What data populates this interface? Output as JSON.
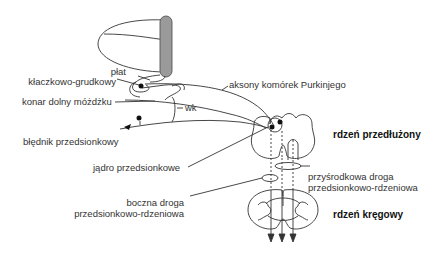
{
  "diagram": {
    "type": "neuroanatomy-schematic",
    "language": "pl",
    "labels": {
      "flocculonodular_lobe_1": "płat",
      "flocculonodular_lobe_2": "kłaczkowo-grudkowy",
      "inferior_cerebellar_peduncle": "konar dolny móżdżku",
      "wk": "wk",
      "purkinje_axons": "aksony komórek Purkinjego",
      "vestibular_labyrinth": "błędnik przedsionkowy",
      "vestibular_nucleus": "jądro przedsionkowe",
      "lateral_tract_1": "boczna droga",
      "lateral_tract_2": "przedsionkowo-rdzeniowa",
      "medial_tract_1": "przyśrodkowa droga",
      "medial_tract_2": "przedsionkowo-rdzeniowa",
      "medulla": "rdzeń przedłużony",
      "spinal_cord": "rdzeń kręgowy"
    },
    "colors": {
      "line": "#333333",
      "cerebellum_fill": "#9a9a9a",
      "text": "#333333"
    }
  }
}
